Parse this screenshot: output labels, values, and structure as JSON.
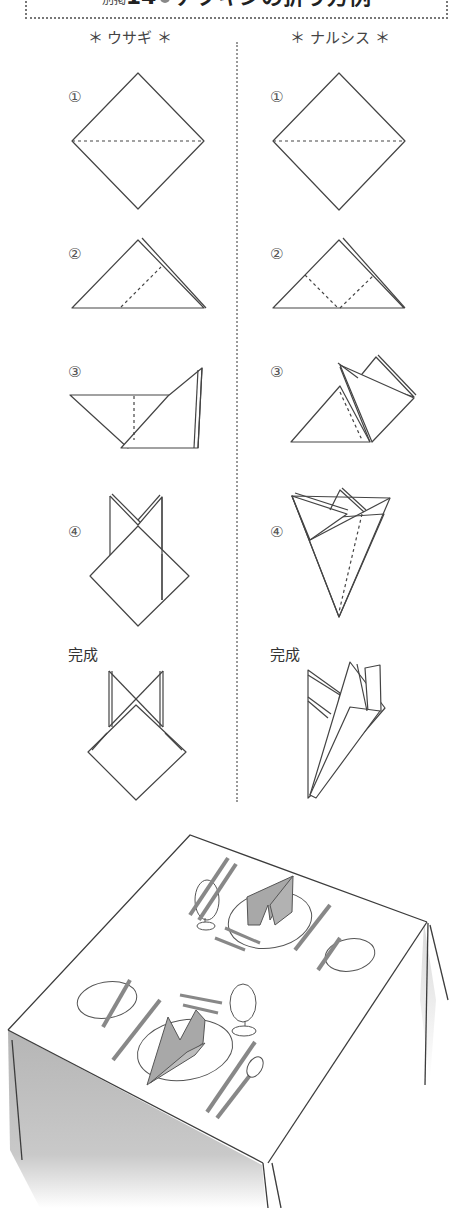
{
  "header": {
    "prefix": "別掲",
    "number": "14",
    "title": "ナプキンの折り方例"
  },
  "columns": [
    {
      "heading": "＊ ウサギ ＊",
      "steps": [
        "①",
        "②",
        "③",
        "④"
      ],
      "final_label": "完成"
    },
    {
      "heading": "＊ ナルシス ＊",
      "steps": [
        "①",
        "②",
        "③",
        "④"
      ],
      "final_label": "完成"
    }
  ],
  "illustration": {
    "subject": "table-setting-with-folded-napkins"
  },
  "colors": {
    "line": "#444444",
    "divider": "#999999",
    "napkin_fill": "#a8a8a8",
    "shadow": "#bdbdbd"
  }
}
